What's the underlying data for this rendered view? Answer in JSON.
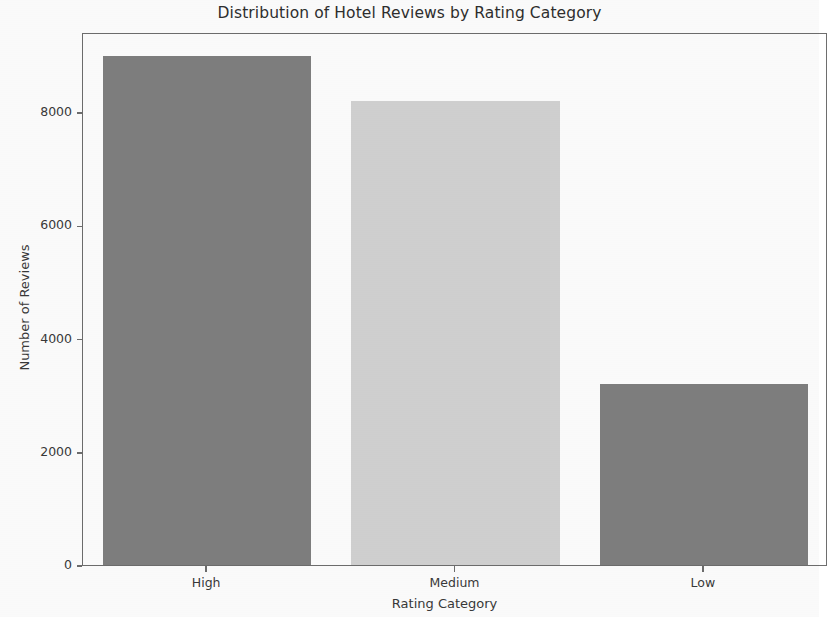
{
  "chart_data": {
    "type": "bar",
    "title": "Distribution of Hotel Reviews by Rating Category",
    "xlabel": "Rating Category",
    "ylabel": "Number of Reviews",
    "categories": [
      "High",
      "Medium",
      "Low"
    ],
    "values": [
      9000,
      8200,
      3200
    ],
    "bar_colors": [
      "#808080",
      "#d3d3d3",
      "#808080"
    ],
    "ylim": [
      0,
      9415
    ],
    "xlim": [
      -0.5,
      2.5
    ],
    "yticks": [
      0,
      2000,
      4000,
      6000,
      8000
    ],
    "ytick_labels": [
      "0",
      "2000",
      "4000",
      "6000",
      "8000"
    ],
    "xtick_labels": [
      "High",
      "Medium",
      "Low"
    ],
    "grid": false,
    "legend": null,
    "axes_color": "#6e6e6e",
    "background_color": "#ffffff"
  }
}
